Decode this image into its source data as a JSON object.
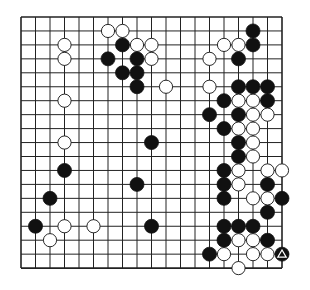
{
  "board": {
    "size": 19,
    "origin": {
      "x": 21,
      "y": 17
    },
    "spacing": {
      "x": 14.5,
      "y": 13.95
    },
    "stone_radius": 7,
    "colors": {
      "background": "#ffffff",
      "line": "#222222",
      "black_stone": "#111111",
      "white_stone": "#ffffff",
      "stone_outline": "#111111",
      "marker": "#ffffff"
    },
    "black_stones": [
      [
        7,
        2
      ],
      [
        6,
        3
      ],
      [
        8,
        3
      ],
      [
        7,
        4
      ],
      [
        8,
        4
      ],
      [
        8,
        5
      ],
      [
        16,
        1
      ],
      [
        16,
        2
      ],
      [
        15,
        3
      ],
      [
        15,
        5
      ],
      [
        16,
        5
      ],
      [
        17,
        5
      ],
      [
        14,
        6
      ],
      [
        17,
        6
      ],
      [
        13,
        7
      ],
      [
        15,
        7
      ],
      [
        14,
        8
      ],
      [
        15,
        9
      ],
      [
        15,
        10
      ],
      [
        14,
        11
      ],
      [
        14,
        12
      ],
      [
        17,
        12
      ],
      [
        14,
        13
      ],
      [
        18,
        13
      ],
      [
        17,
        14
      ],
      [
        14,
        15
      ],
      [
        15,
        15
      ],
      [
        16,
        15
      ],
      [
        14,
        16
      ],
      [
        17,
        16
      ],
      [
        13,
        17
      ],
      [
        18,
        17
      ],
      [
        9,
        9
      ],
      [
        8,
        12
      ],
      [
        9,
        15
      ],
      [
        3,
        11
      ],
      [
        2,
        13
      ],
      [
        1,
        15
      ]
    ],
    "white_stones": [
      [
        6,
        1
      ],
      [
        7,
        1
      ],
      [
        8,
        2
      ],
      [
        9,
        2
      ],
      [
        9,
        3
      ],
      [
        3,
        2
      ],
      [
        3,
        3
      ],
      [
        3,
        6
      ],
      [
        3,
        9
      ],
      [
        10,
        5
      ],
      [
        13,
        5
      ],
      [
        14,
        2
      ],
      [
        15,
        2
      ],
      [
        13,
        3
      ],
      [
        15,
        6
      ],
      [
        16,
        6
      ],
      [
        16,
        7
      ],
      [
        17,
        7
      ],
      [
        15,
        8
      ],
      [
        16,
        8
      ],
      [
        16,
        9
      ],
      [
        16,
        10
      ],
      [
        15,
        11
      ],
      [
        17,
        11
      ],
      [
        18,
        11
      ],
      [
        15,
        12
      ],
      [
        16,
        13
      ],
      [
        17,
        13
      ],
      [
        15,
        16
      ],
      [
        16,
        16
      ],
      [
        14,
        17
      ],
      [
        16,
        17
      ],
      [
        17,
        17
      ],
      [
        15,
        18
      ],
      [
        3,
        15
      ],
      [
        5,
        15
      ],
      [
        2,
        16
      ]
    ],
    "markers": [
      {
        "type": "triangle",
        "col": 18,
        "row": 17,
        "on": "black"
      }
    ]
  }
}
